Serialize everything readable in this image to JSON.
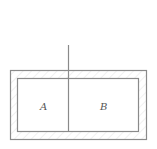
{
  "diagram": {
    "type": "physics-container-with-partition",
    "labels": {
      "left_compartment": "A",
      "right_compartment": "B"
    },
    "colors": {
      "line": "#8a8a8a",
      "background": "#ffffff",
      "label": "#555555"
    }
  }
}
